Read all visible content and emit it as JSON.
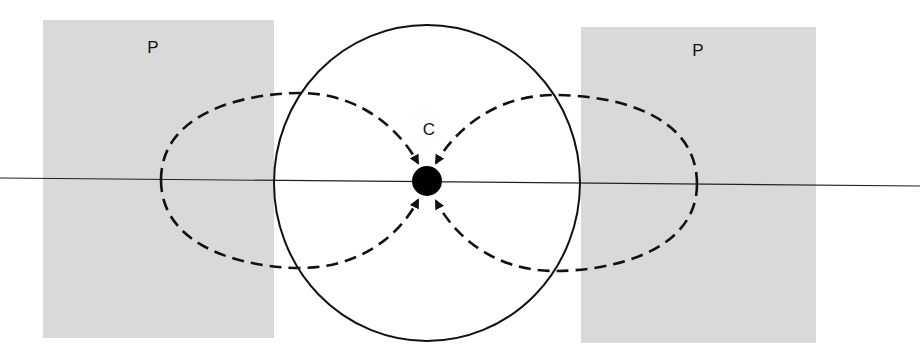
{
  "diagram": {
    "labels": {
      "left_region": "P",
      "right_region": "P",
      "center": "C"
    },
    "colors": {
      "region_fill": "#d9d9d9",
      "stroke": "#111111",
      "background": "#ffffff"
    },
    "elements": {
      "left_region": {
        "x": 43,
        "y": 20,
        "w": 231,
        "h": 318
      },
      "right_region": {
        "x": 581,
        "y": 27,
        "w": 235,
        "h": 316
      },
      "circle": {
        "cx": 427,
        "cy": 183,
        "rx": 153,
        "ry": 158
      },
      "center_dot": {
        "cx": 427,
        "cy": 181,
        "r": 15
      },
      "axis_line": {
        "x1": 0,
        "y1": 178,
        "x2": 920,
        "y2": 186
      }
    }
  }
}
